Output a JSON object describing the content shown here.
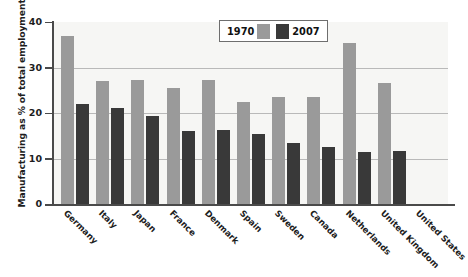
{
  "chart_data": {
    "type": "bar",
    "title": "",
    "xlabel": "",
    "ylabel": "Manufacturing as % of total employment",
    "ylim": [
      0,
      40
    ],
    "yticks": [
      "0",
      "10",
      "20",
      "30",
      "40"
    ],
    "grid": true,
    "legend_position": "top-center",
    "categories": [
      "Germany",
      "Italy",
      "Japan",
      "France",
      "Denmark",
      "Spain",
      "Sweden",
      "Canada",
      "Netherlands",
      "United Kingdom",
      "United States"
    ],
    "series": [
      {
        "name": "1970",
        "color": "#9a9a9a",
        "values": [
          37.0,
          27.1,
          27.2,
          25.4,
          27.3,
          22.4,
          23.5,
          23.6,
          35.4,
          26.7,
          0
        ]
      },
      {
        "name": "2007",
        "color": "#393939",
        "values": [
          22.0,
          21.1,
          19.3,
          16.1,
          16.2,
          15.3,
          13.5,
          12.5,
          11.5,
          11.7,
          0
        ]
      }
    ]
  },
  "legend": {
    "entries": [
      {
        "label": "1970",
        "swatch": "#9a9a9a"
      },
      {
        "label": "2007",
        "swatch": "#393939"
      }
    ]
  }
}
